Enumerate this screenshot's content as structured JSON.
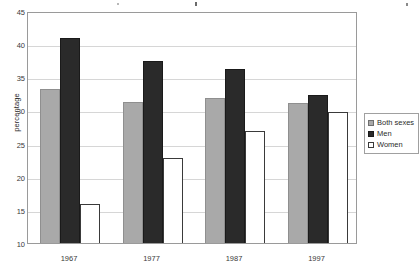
{
  "chart_data": {
    "type": "bar",
    "title": "",
    "subtitle": "",
    "xlabel": "",
    "ylabel": "percentage",
    "categories": [
      "1967",
      "1977",
      "1987",
      "1997"
    ],
    "series": [
      {
        "name": "Both sexes",
        "color": "#a9a9a9",
        "values": [
          33.3,
          31.2,
          31.9,
          31.1
        ]
      },
      {
        "name": "Men",
        "color": "#2a2a2a",
        "values": [
          41.0,
          37.4,
          36.2,
          32.4
        ]
      },
      {
        "name": "Women",
        "color": "#ffffff",
        "values": [
          15.9,
          22.9,
          26.9,
          29.7
        ]
      }
    ],
    "ylim": [
      10,
      45
    ],
    "ytick_step": 5,
    "yticks": [
      10,
      15,
      20,
      25,
      30,
      35,
      40,
      45
    ],
    "ytick_labels": [
      "10",
      "15",
      "20",
      "25",
      "30",
      "35",
      "40",
      "45"
    ],
    "grid": true,
    "grid_axis": "y",
    "legend_position": "right",
    "legend_entries": [
      "Both sexes",
      "Men",
      "Women"
    ]
  },
  "axes": {
    "y_title": "percentage"
  },
  "legend": {
    "items": [
      {
        "label": "Both sexes"
      },
      {
        "label": "Men"
      },
      {
        "label": "Women"
      }
    ]
  }
}
